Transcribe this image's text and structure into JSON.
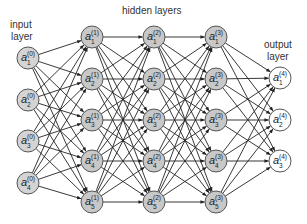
{
  "diagram": {
    "labels": {
      "input": [
        "input",
        "layer"
      ],
      "hidden": "hidden layers",
      "output": [
        "output",
        "layer"
      ]
    },
    "colors": {
      "hidden_fill": "#c8c8c8",
      "input_fill": "#d4d4d4",
      "output_fill": "#ffffff",
      "stroke": "#555555",
      "edge": "#222222"
    },
    "node_radius": 11,
    "layers": [
      {
        "name": "input",
        "index": 0,
        "x": 28,
        "fill": "#d4d4d4",
        "nodes": [
          {
            "label": "a",
            "sub": "1",
            "sup": "(0)",
            "y": 58
          },
          {
            "label": "a",
            "sub": "2",
            "sup": "(0)",
            "y": 100
          },
          {
            "label": "a",
            "sub": "3",
            "sup": "(0)",
            "y": 141
          },
          {
            "label": "a",
            "sub": "4",
            "sup": "(0)",
            "y": 183
          }
        ]
      },
      {
        "name": "hidden-1",
        "index": 1,
        "x": 92,
        "fill": "#c8c8c8",
        "nodes": [
          {
            "label": "a",
            "sub": "1",
            "sup": "(1)",
            "y": 37
          },
          {
            "label": "a",
            "sub": "2",
            "sup": "(1)",
            "y": 79
          },
          {
            "label": "a",
            "sub": "3",
            "sup": "(1)",
            "y": 120
          },
          {
            "label": "a",
            "sub": "4",
            "sup": "(1)",
            "y": 161
          },
          {
            "label": "a",
            "sub": "5",
            "sup": "(1)",
            "y": 202
          }
        ]
      },
      {
        "name": "hidden-2",
        "index": 2,
        "x": 154,
        "fill": "#c8c8c8",
        "nodes": [
          {
            "label": "a",
            "sub": "1",
            "sup": "(2)",
            "y": 37
          },
          {
            "label": "a",
            "sub": "2",
            "sup": "(2)",
            "y": 79
          },
          {
            "label": "a",
            "sub": "3",
            "sup": "(2)",
            "y": 120
          },
          {
            "label": "a",
            "sub": "4",
            "sup": "(2)",
            "y": 161
          },
          {
            "label": "a",
            "sub": "5",
            "sup": "(2)",
            "y": 202
          }
        ]
      },
      {
        "name": "hidden-3",
        "index": 3,
        "x": 216,
        "fill": "#c8c8c8",
        "nodes": [
          {
            "label": "a",
            "sub": "1",
            "sup": "(3)",
            "y": 37
          },
          {
            "label": "a",
            "sub": "2",
            "sup": "(3)",
            "y": 79
          },
          {
            "label": "a",
            "sub": "3",
            "sup": "(3)",
            "y": 120
          },
          {
            "label": "a",
            "sub": "4",
            "sup": "(3)",
            "y": 161
          },
          {
            "label": "a",
            "sub": "5",
            "sup": "(3)",
            "y": 202
          }
        ]
      },
      {
        "name": "output",
        "index": 4,
        "x": 280,
        "fill": "#ffffff",
        "nodes": [
          {
            "label": "a",
            "sub": "1",
            "sup": "(4)",
            "y": 78
          },
          {
            "label": "a",
            "sub": "2",
            "sup": "(4)",
            "y": 120
          },
          {
            "label": "a",
            "sub": "3",
            "sup": "(4)",
            "y": 161
          }
        ]
      }
    ],
    "connectivity": "fully-connected between consecutive layers"
  }
}
